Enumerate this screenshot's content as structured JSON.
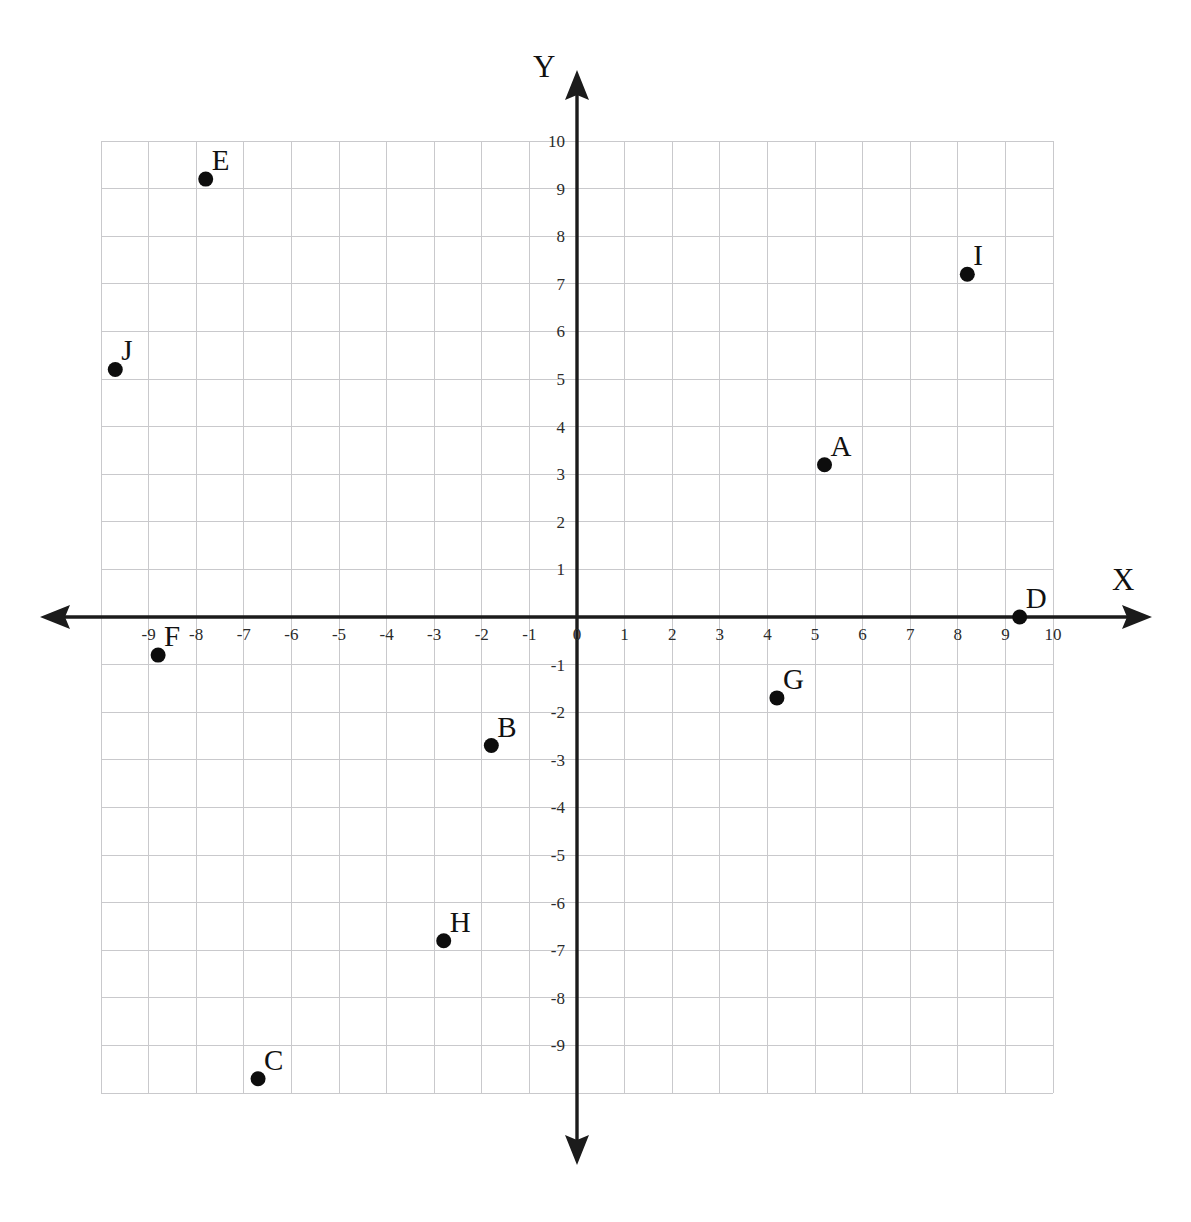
{
  "chart_data": {
    "type": "scatter",
    "title": "",
    "xlabel": "X",
    "ylabel": "Y",
    "xlim": [
      -10,
      10
    ],
    "ylim": [
      -10,
      10
    ],
    "grid": true,
    "legend": "none",
    "x_tick_labels": [
      "-9",
      "-8",
      "-7",
      "-6",
      "-5",
      "-4",
      "-3",
      "-2",
      "-1",
      "0",
      "1",
      "2",
      "3",
      "4",
      "5",
      "6",
      "7",
      "8",
      "9",
      "10"
    ],
    "x_tick_values": [
      -9,
      -8,
      -7,
      -6,
      -5,
      -4,
      -3,
      -2,
      -1,
      0,
      1,
      2,
      3,
      4,
      5,
      6,
      7,
      8,
      9,
      10
    ],
    "y_tick_labels": [
      "10",
      "9",
      "8",
      "7",
      "6",
      "5",
      "4",
      "3",
      "2",
      "1",
      "-1",
      "-2",
      "-3",
      "-4",
      "-5",
      "-6",
      "-7",
      "-8",
      "-9"
    ],
    "y_tick_values": [
      10,
      9,
      8,
      7,
      6,
      5,
      4,
      3,
      2,
      1,
      -1,
      -2,
      -3,
      -4,
      -5,
      -6,
      -7,
      -8,
      -9
    ],
    "points": [
      {
        "label": "A",
        "x": 5.2,
        "y": 3.2
      },
      {
        "label": "B",
        "x": -1.8,
        "y": -2.7
      },
      {
        "label": "C",
        "x": -6.7,
        "y": -9.7
      },
      {
        "label": "D",
        "x": 9.3,
        "y": 0
      },
      {
        "label": "E",
        "x": -7.8,
        "y": 9.2
      },
      {
        "label": "F",
        "x": -8.8,
        "y": -0.8
      },
      {
        "label": "G",
        "x": 4.2,
        "y": -1.7
      },
      {
        "label": "H",
        "x": -2.8,
        "y": -6.8
      },
      {
        "label": "I",
        "x": 8.2,
        "y": 7.2
      },
      {
        "label": "J",
        "x": -9.7,
        "y": 5.2
      }
    ]
  },
  "style": {
    "point_color": "#0d0d0d",
    "axis_color": "#1b1b1b",
    "grid_color": "#c9c9cc",
    "background": "#ffffff"
  }
}
